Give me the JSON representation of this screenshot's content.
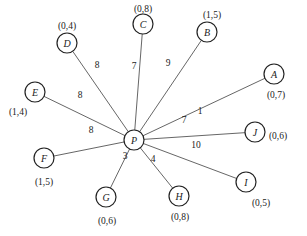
{
  "diagram": {
    "type": "star-graph",
    "center": {
      "id": "P",
      "label": "P",
      "x": 134,
      "y": 140
    },
    "nodes": [
      {
        "id": "A",
        "label": "A",
        "coord": "(0,7)",
        "weight": "1",
        "x": 274,
        "y": 74,
        "cx": 276,
        "cy": 95,
        "wx": 200,
        "wy": 114
      },
      {
        "id": "B",
        "label": "B",
        "coord": "(1,5)",
        "weight": "9",
        "x": 207,
        "y": 32,
        "cx": 212,
        "cy": 15,
        "wx": 168,
        "wy": 66
      },
      {
        "id": "C",
        "label": "C",
        "coord": "(0,8)",
        "weight": "7",
        "x": 143,
        "y": 24,
        "cx": 143,
        "cy": 9,
        "wx": 134,
        "wy": 69
      },
      {
        "id": "D",
        "label": "D",
        "coord": "(0,4)",
        "weight": "8",
        "x": 67,
        "y": 43,
        "cx": 67,
        "cy": 26,
        "wx": 97,
        "wy": 68
      },
      {
        "id": "E",
        "label": "E",
        "coord": "(1,4)",
        "weight": "8",
        "x": 35,
        "y": 92,
        "cx": 18,
        "cy": 112,
        "wx": 80,
        "wy": 98
      },
      {
        "id": "F",
        "label": "F",
        "coord": "(1,5)",
        "weight": "8",
        "x": 44,
        "y": 158,
        "cx": 44,
        "cy": 182,
        "wx": 91,
        "wy": 133
      },
      {
        "id": "G",
        "label": "G",
        "coord": "(0,6)",
        "weight": "3",
        "x": 106,
        "y": 197,
        "cx": 107,
        "cy": 221,
        "wx": 125,
        "wy": 159
      },
      {
        "id": "H",
        "label": "H",
        "coord": "(0,8)",
        "weight": "4",
        "x": 179,
        "y": 196,
        "cx": 180,
        "cy": 217,
        "wx": 153,
        "wy": 162
      },
      {
        "id": "I",
        "label": "I",
        "coord": "(0,5)",
        "weight": "10",
        "x": 246,
        "y": 182,
        "cx": 261,
        "cy": 203,
        "wx": 196,
        "wy": 148
      },
      {
        "id": "J",
        "label": "J",
        "coord": "(0,6)",
        "weight": "7",
        "x": 255,
        "y": 132,
        "cx": 278,
        "cy": 136,
        "wx": 184,
        "wy": 123
      }
    ]
  }
}
